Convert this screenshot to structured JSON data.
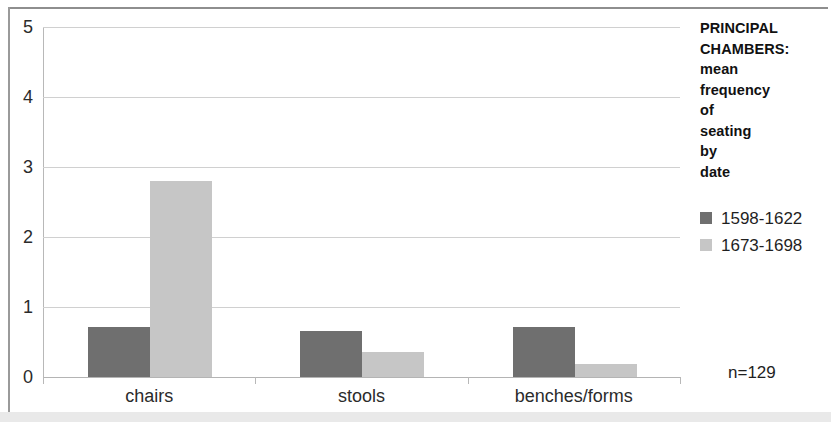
{
  "chart_data": {
    "type": "bar",
    "title": "PRINCIPAL CHAMBERS: mean frequency of seating by date",
    "title_lines": [
      "PRINCIPAL",
      "CHAMBERS:",
      "mean",
      "frequency of",
      "seating by",
      "date"
    ],
    "xlabel": "",
    "ylabel": "",
    "categories": [
      "chairs",
      "stools",
      "benches/forms"
    ],
    "series": [
      {
        "name": "1598-1622",
        "color": "#6f6f6f",
        "values": [
          0.72,
          0.66,
          0.72
        ]
      },
      {
        "name": "1673-1698",
        "color": "#c6c6c6",
        "values": [
          2.8,
          0.36,
          0.19
        ]
      }
    ],
    "ylim": [
      0,
      5
    ],
    "yticks": [
      0,
      1,
      2,
      3,
      4,
      5
    ],
    "ytick_labels": [
      "0",
      "1",
      "2",
      "3",
      "4",
      "5"
    ],
    "grid": true,
    "legend_position": "right",
    "annotations": [
      {
        "name": "sample-size",
        "text": "n=129"
      }
    ]
  },
  "legend": {
    "title_lines": [
      "PRINCIPAL",
      "CHAMBERS:",
      "mean",
      "frequency of",
      "seating by",
      "date"
    ],
    "entries": [
      {
        "label": "1598-1622",
        "color": "#6f6f6f"
      },
      {
        "label": "1673-1698",
        "color": "#c6c6c6"
      }
    ]
  },
  "annotation": {
    "sample_size": "n=129"
  }
}
